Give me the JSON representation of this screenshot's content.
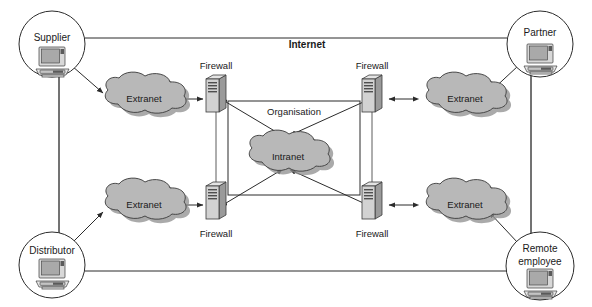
{
  "diagram": {
    "boundary_label": "Internet",
    "organisation_label": "Organisation",
    "colors": {
      "background": "#ffffff",
      "line": "#2b2b2b",
      "cloud_fill": "#b8b8b8",
      "cloud_shadow": "#8e8e8e",
      "server_front": "#d2d2d2",
      "server_side": "#9a9a9a",
      "text": "#1a1a1a"
    },
    "nodes": {
      "supplier": {
        "label": "Supplier",
        "icon": "workstation-icon"
      },
      "distributor": {
        "label": "Distributor",
        "icon": "workstation-icon"
      },
      "partner": {
        "label": "Partner",
        "icon": "workstation-icon"
      },
      "remote_employee": {
        "label_line1": "Remote",
        "label_line2": "employee",
        "icon": "workstation-icon"
      }
    },
    "clouds": {
      "extranet_top_left": {
        "label": "Extranet",
        "icon": "cloud-icon"
      },
      "extranet_bottom_left": {
        "label": "Extranet",
        "icon": "cloud-icon"
      },
      "extranet_top_right": {
        "label": "Extranet",
        "icon": "cloud-icon"
      },
      "extranet_bottom_right": {
        "label": "Extranet",
        "icon": "cloud-icon"
      },
      "intranet": {
        "label": "Intranet",
        "icon": "cloud-icon"
      }
    },
    "firewalls": {
      "top_left": {
        "label": "Firewall",
        "icon": "server-icon",
        "label_position": "above"
      },
      "top_right": {
        "label": "Firewall",
        "icon": "server-icon",
        "label_position": "above"
      },
      "bottom_left": {
        "label": "Firewall",
        "icon": "server-icon",
        "label_position": "below"
      },
      "bottom_right": {
        "label": "Firewall",
        "icon": "server-icon",
        "label_position": "below"
      }
    }
  }
}
